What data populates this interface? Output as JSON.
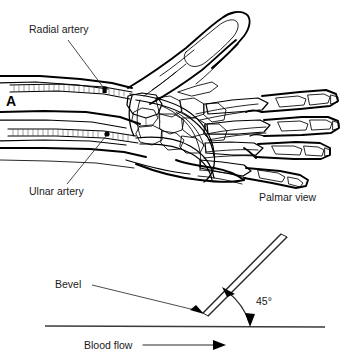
{
  "figure": {
    "background_color": "#ffffff",
    "ink_color": "#000000"
  },
  "panel_a": {
    "letter": "A",
    "view_caption": "Palmar view",
    "labels": {
      "radial_artery": "Radial artery",
      "ulnar_artery": "Ulnar artery"
    },
    "anatomy_parts": [
      "radial artery",
      "ulnar artery",
      "superficial palmar arch",
      "deep palmar arch",
      "metacarpal bones",
      "carpal bones",
      "phalanges",
      "thumb",
      "radius",
      "ulna"
    ],
    "puncture_sites": [
      {
        "name": "radial-puncture-site"
      },
      {
        "name": "ulnar-puncture-site"
      }
    ]
  },
  "panel_b": {
    "labels": {
      "bevel": "Bevel",
      "angle": "45°",
      "blood_flow": "Blood flow"
    },
    "needle": {
      "insertion_angle_degrees": 45,
      "bevel_orientation": "up"
    },
    "vessel": {
      "flow_direction": "left-to-right"
    }
  }
}
